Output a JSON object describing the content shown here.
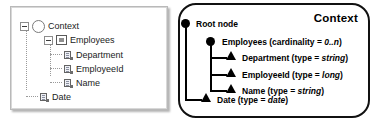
{
  "diagram": {
    "tree_panel": {
      "name": "tree-view-panel",
      "rows": [
        {
          "label": "Context",
          "icon": "circle-node-icon",
          "expander": "collapse-toggle",
          "indent": 0
        },
        {
          "label": "Employees",
          "icon": "element-node-icon",
          "expander": "collapse-toggle",
          "indent": 1
        },
        {
          "label": "Department",
          "icon": "attribute-node-icon",
          "expander": "none",
          "indent": 2
        },
        {
          "label": "EmployeeId",
          "icon": "attribute-node-icon",
          "expander": "none",
          "indent": 2
        },
        {
          "label": "Name",
          "icon": "attribute-node-icon",
          "expander": "none",
          "indent": 2
        },
        {
          "label": "Date",
          "icon": "attribute-node-icon",
          "expander": "none",
          "indent": 1
        }
      ]
    },
    "schema_panel": {
      "name": "schematic-notation-panel",
      "title": "Context",
      "rows": [
        {
          "marker": "filled-circle-marker",
          "text_plain": "Root node",
          "text_italic": "",
          "text_tail": ""
        },
        {
          "marker": "filled-circle-marker",
          "text_plain": "Employees (cardinality = ",
          "text_italic": "0..n",
          "text_tail": ")"
        },
        {
          "marker": "filled-triangle-marker",
          "text_plain": "Department (type = ",
          "text_italic": "string",
          "text_tail": ")"
        },
        {
          "marker": "filled-triangle-marker",
          "text_plain": "EmployeeId (type = ",
          "text_italic": "long",
          "text_tail": ")"
        },
        {
          "marker": "filled-triangle-marker",
          "text_plain": "Name (type = ",
          "text_italic": "string",
          "text_tail": ")"
        },
        {
          "marker": "filled-triangle-marker",
          "text_plain": "Date (type = ",
          "text_italic": "date",
          "text_tail": ")"
        }
      ]
    },
    "colors": {
      "panel_border": "#b9b9b9",
      "tree_line": "#9a9a9a",
      "schema_stroke": "#111111",
      "text": "#000000"
    }
  }
}
